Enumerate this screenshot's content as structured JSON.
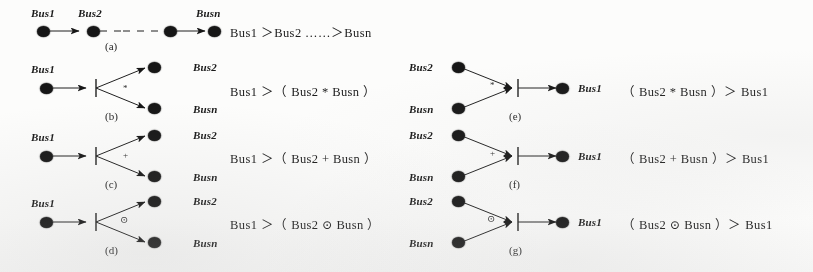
{
  "figure": {
    "type": "petri-net-precedence-diagrams",
    "background_color": "#fdfdfc",
    "ink_color": "#101010"
  },
  "subfigures": [
    {
      "id": "a",
      "caption": "(a)",
      "formula": "Bus1 ＞Bus2 ……＞Busn",
      "operator": "",
      "node_labels": [
        "Bus1",
        "Bus2",
        "Busn"
      ],
      "layout": "chain"
    },
    {
      "id": "b",
      "caption": "(b)",
      "formula": "Bus1 ＞（ Bus2 * Busn ）",
      "operator": "*",
      "node_labels": [
        "Bus1",
        "Bus2",
        "Busn"
      ],
      "layout": "fan-out"
    },
    {
      "id": "c",
      "caption": "(c)",
      "formula": "Bus1 ＞（ Bus2 + Busn ）",
      "operator": "+",
      "node_labels": [
        "Bus1",
        "Bus2",
        "Busn"
      ],
      "layout": "fan-out"
    },
    {
      "id": "d",
      "caption": "(d)",
      "formula": "Bus1 ＞（ Bus2 ⊙ Busn ）",
      "operator": "⊙",
      "node_labels": [
        "Bus1",
        "Bus2",
        "Busn"
      ],
      "layout": "fan-out"
    },
    {
      "id": "e",
      "caption": "(e)",
      "formula": "（ Bus2 * Busn ）＞ Bus1",
      "operator": "*",
      "node_labels": [
        "Bus2",
        "Busn",
        "Bus1"
      ],
      "layout": "fan-in"
    },
    {
      "id": "f",
      "caption": "(f)",
      "formula": "（ Bus2 + Busn ）＞ Bus1",
      "operator": "+",
      "node_labels": [
        "Bus2",
        "Busn",
        "Bus1"
      ],
      "layout": "fan-in"
    },
    {
      "id": "g",
      "caption": "(g)",
      "formula": "（ Bus2 ⊙ Busn ）＞ Bus1",
      "operator": "⊙",
      "node_labels": [
        "Bus2",
        "Busn",
        "Bus1"
      ],
      "layout": "fan-in"
    }
  ],
  "labels": {
    "a_bus1": "Bus1",
    "a_bus2": "Bus2",
    "a_busn": "Busn",
    "b_bus1": "Bus1",
    "b_bus2": "Bus2",
    "b_busn": "Busn",
    "c_bus1": "Bus1",
    "c_bus2": "Bus2",
    "c_busn": "Busn",
    "d_bus1": "Bus1",
    "d_bus2": "Bus2",
    "d_busn": "Busn",
    "e_bus2": "Bus2",
    "e_busn": "Busn",
    "e_bus1": "Bus1",
    "f_bus2": "Bus2",
    "f_busn": "Busn",
    "f_bus1": "Bus1",
    "g_bus2": "Bus2",
    "g_busn": "Busn",
    "g_bus1": "Bus1"
  }
}
